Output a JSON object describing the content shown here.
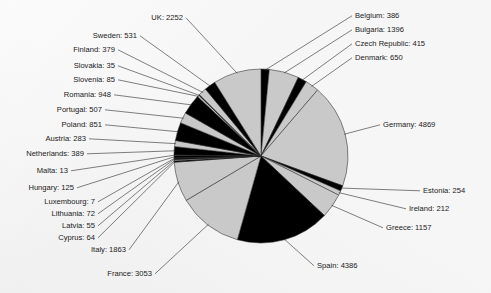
{
  "chart_data": {
    "type": "pie",
    "title": "",
    "subtitle": "",
    "xlabel": "",
    "ylabel": "",
    "legend_position": "none",
    "grid": false,
    "label_format": "{name}: {value}",
    "start_angle_deg": 0,
    "direction": "clockwise",
    "total": 27589,
    "categories": [
      "Belgium",
      "Bulgaria",
      "Czech Republic",
      "Denmark",
      "Germany",
      "Estonia",
      "Ireland",
      "Greece",
      "Spain",
      "France",
      "Italy",
      "Cyprus",
      "Latvia",
      "Lithuania",
      "Luxembourg",
      "Hungary",
      "Malta",
      "Netherlands",
      "Austria",
      "Poland",
      "Portugal",
      "Romania",
      "Slovenia",
      "Slovakia",
      "Finland",
      "Sweden",
      "UK"
    ],
    "values": [
      386,
      1396,
      415,
      650,
      4869,
      254,
      212,
      1157,
      4386,
      3053,
      1863,
      64,
      55,
      72,
      7,
      125,
      13,
      389,
      283,
      851,
      507,
      948,
      85,
      35,
      379,
      531,
      2252
    ],
    "slice_colors": [
      "#000000",
      "#c9c9c9",
      "#000000",
      "#c9c9c9",
      "#c9c9c9",
      "#000000",
      "#c9c9c9",
      "#c9c9c9",
      "#000000",
      "#c9c9c9",
      "#c9c9c9",
      "#000000",
      "#c9c9c9",
      "#000000",
      "#c9c9c9",
      "#000000",
      "#c9c9c9",
      "#000000",
      "#c9c9c9",
      "#000000",
      "#c9c9c9",
      "#000000",
      "#c9c9c9",
      "#000000",
      "#c9c9c9",
      "#000000",
      "#c9c9c9"
    ],
    "labels": [
      {
        "name": "Belgium",
        "text": "Belgium: 386",
        "side": "right",
        "x": 355,
        "y": 18
      },
      {
        "name": "Bulgaria",
        "text": "Bulgaria: 1396",
        "side": "right",
        "x": 355,
        "y": 32
      },
      {
        "name": "Czech Republic",
        "text": "Czech Republic: 415",
        "side": "right",
        "x": 355,
        "y": 46
      },
      {
        "name": "Denmark",
        "text": "Denmark: 650",
        "side": "right",
        "x": 355,
        "y": 60
      },
      {
        "name": "Germany",
        "text": "Germany: 4869",
        "side": "right",
        "x": 383,
        "y": 127
      },
      {
        "name": "Estonia",
        "text": "Estonia: 254",
        "side": "right",
        "x": 423,
        "y": 193
      },
      {
        "name": "Ireland",
        "text": "Ireland: 212",
        "side": "right",
        "x": 409,
        "y": 211
      },
      {
        "name": "Greece",
        "text": "Greece: 1157",
        "side": "right",
        "x": 386,
        "y": 230
      },
      {
        "name": "Spain",
        "text": "Spain: 4386",
        "side": "right",
        "x": 317,
        "y": 268
      },
      {
        "name": "France",
        "text": "France: 3053",
        "side": "left",
        "x": 152,
        "y": 276
      },
      {
        "name": "Italy",
        "text": "Italy: 1863",
        "side": "left",
        "x": 126,
        "y": 252
      },
      {
        "name": "Cyprus",
        "text": "Cyprus: 64",
        "side": "left",
        "x": 95,
        "y": 240
      },
      {
        "name": "Latvia",
        "text": "Latvia: 55",
        "side": "left",
        "x": 95,
        "y": 228
      },
      {
        "name": "Lithuania",
        "text": "Lithuania: 72",
        "side": "left",
        "x": 95,
        "y": 216
      },
      {
        "name": "Luxembourg",
        "text": "Luxembourg: 7",
        "side": "left",
        "x": 95,
        "y": 204
      },
      {
        "name": "Hungary",
        "text": "Hungary: 125",
        "side": "left",
        "x": 74,
        "y": 190
      },
      {
        "name": "Malta",
        "text": "Malta: 13",
        "side": "left",
        "x": 68,
        "y": 173
      },
      {
        "name": "Netherlands",
        "text": "Netherlands: 389",
        "side": "left",
        "x": 84,
        "y": 156
      },
      {
        "name": "Austria",
        "text": "Austria: 283",
        "side": "left",
        "x": 86,
        "y": 141
      },
      {
        "name": "Poland",
        "text": "Poland: 851",
        "side": "left",
        "x": 102,
        "y": 127
      },
      {
        "name": "Portugal",
        "text": "Portugal: 507",
        "side": "left",
        "x": 102,
        "y": 112
      },
      {
        "name": "Romania",
        "text": "Romania: 948",
        "side": "left",
        "x": 111,
        "y": 97
      },
      {
        "name": "Slovenia",
        "text": "Slovenia: 85",
        "side": "left",
        "x": 115,
        "y": 82
      },
      {
        "name": "Slovakia",
        "text": "Slovakia: 35",
        "side": "left",
        "x": 115,
        "y": 68
      },
      {
        "name": "Finland",
        "text": "Finland: 379",
        "side": "left",
        "x": 115,
        "y": 52
      },
      {
        "name": "Sweden",
        "text": "Sweden: 531",
        "side": "left",
        "x": 137,
        "y": 38
      },
      {
        "name": "UK",
        "text": "UK: 2252",
        "side": "left",
        "x": 183,
        "y": 20
      }
    ]
  },
  "pie": {
    "cx": 261,
    "cy": 156,
    "r": 87
  }
}
